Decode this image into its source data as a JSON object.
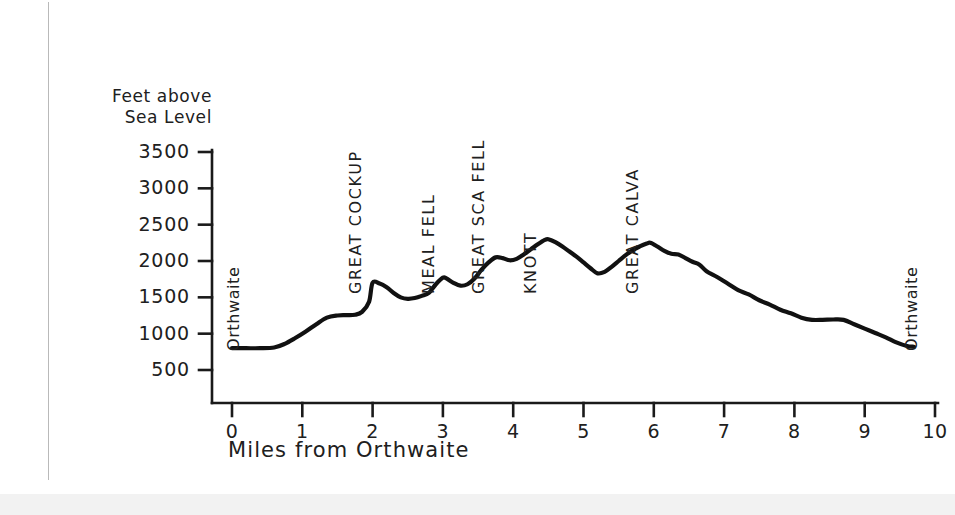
{
  "figure": {
    "name": "elevation-profile-orthwaite-round",
    "background_color": "#ffffff",
    "ink_color": "#1a1a1a",
    "margin_line_color": "#b9b9b9"
  },
  "axes": {
    "y_title_line1": "Feet above",
    "y_title_line2": "Sea Level",
    "x_title": "Miles from Orthwaite",
    "y_ticks": [
      "3500",
      "3000",
      "2500",
      "2000",
      "1500",
      "1000",
      "500"
    ],
    "x_ticks": [
      "0",
      "1",
      "2",
      "3",
      "4",
      "5",
      "6",
      "7",
      "8",
      "9",
      "10"
    ]
  },
  "annotations": {
    "start_label": "Orthwaite",
    "end_label": "Orthwaite",
    "peaks": [
      {
        "name": "GREAT COCKUP",
        "mile": 2.0,
        "elevation": 1700
      },
      {
        "name": "MEAL FELL",
        "mile": 3.05,
        "elevation": 1770
      },
      {
        "name": "GREAT SCA FELL",
        "mile": 3.75,
        "elevation": 2050
      },
      {
        "name": "KNOTT",
        "mile": 4.5,
        "elevation": 2300
      },
      {
        "name": "GREAT CALVA",
        "mile": 5.95,
        "elevation": 2250
      }
    ]
  },
  "chart_data": {
    "type": "line",
    "title": "",
    "xlabel": "Miles from Orthwaite",
    "ylabel": "Feet above Sea Level",
    "xlim": [
      0,
      10
    ],
    "ylim": [
      0,
      3500
    ],
    "grid": false,
    "legend": null,
    "series": [
      {
        "name": "Ridge walk elevation profile",
        "x": [
          0.0,
          0.2,
          0.4,
          0.6,
          0.75,
          0.9,
          1.05,
          1.2,
          1.35,
          1.5,
          1.62,
          1.75,
          1.85,
          1.95,
          2.0,
          2.1,
          2.2,
          2.3,
          2.4,
          2.5,
          2.6,
          2.7,
          2.8,
          2.9,
          3.0,
          3.05,
          3.15,
          3.25,
          3.35,
          3.45,
          3.55,
          3.65,
          3.75,
          3.85,
          3.95,
          4.05,
          4.15,
          4.25,
          4.35,
          4.45,
          4.5,
          4.6,
          4.7,
          4.8,
          4.9,
          5.0,
          5.1,
          5.2,
          5.3,
          5.4,
          5.5,
          5.6,
          5.7,
          5.8,
          5.9,
          5.95,
          6.05,
          6.15,
          6.25,
          6.35,
          6.45,
          6.55,
          6.65,
          6.75,
          6.9,
          7.05,
          7.2,
          7.35,
          7.5,
          7.65,
          7.8,
          7.95,
          8.1,
          8.25,
          8.4,
          8.55,
          8.7,
          8.85,
          9.0,
          9.15,
          9.3,
          9.45,
          9.6,
          9.7
        ],
        "y": [
          800,
          800,
          800,
          810,
          860,
          940,
          1030,
          1130,
          1220,
          1250,
          1255,
          1260,
          1300,
          1440,
          1700,
          1690,
          1640,
          1560,
          1500,
          1480,
          1490,
          1520,
          1560,
          1680,
          1770,
          1760,
          1700,
          1660,
          1680,
          1760,
          1880,
          1980,
          2050,
          2040,
          2010,
          2030,
          2090,
          2160,
          2230,
          2290,
          2300,
          2260,
          2200,
          2130,
          2060,
          1980,
          1900,
          1830,
          1850,
          1920,
          2000,
          2080,
          2150,
          2200,
          2240,
          2250,
          2200,
          2140,
          2100,
          2090,
          2040,
          1990,
          1950,
          1860,
          1780,
          1690,
          1600,
          1540,
          1460,
          1400,
          1330,
          1280,
          1220,
          1190,
          1190,
          1195,
          1190,
          1130,
          1070,
          1010,
          950,
          880,
          830,
          820
        ]
      }
    ]
  }
}
